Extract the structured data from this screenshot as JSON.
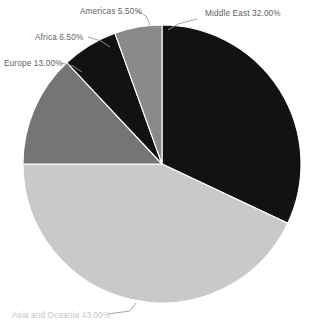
{
  "chart_data": {
    "type": "pie",
    "title": "",
    "subtitle": "",
    "xlabel": "",
    "ylabel": "",
    "legend_position": "none",
    "grid": false,
    "label_format": "{name} {value}%",
    "start_angle_deg": 0,
    "direction": "clockwise",
    "categories": [
      "Middle East",
      "Asia and Oceania",
      "Europe",
      "Africa",
      "Americas"
    ],
    "values": [
      32.0,
      43.0,
      13.0,
      6.5,
      5.5
    ],
    "total": 100.0,
    "slices": [
      {
        "name": "Middle East",
        "value": 32.0,
        "value_text": "32.00%",
        "label": "Middle East 32.00%",
        "color": "#121212",
        "start_angle": 0,
        "end_angle": 115.2,
        "label_anchor": "start",
        "label_x": 205,
        "label_y": 16,
        "leader": "M 197 19 L 178 24 L 168 30",
        "faint": false
      },
      {
        "name": "Asia and Oceania",
        "value": 43.0,
        "value_text": "43.00%",
        "label": "Asia and Oceania 43.00%",
        "color": "#c9c9c9",
        "start_angle": 115.2,
        "end_angle": 270.0,
        "label_anchor": "start",
        "label_x": 12,
        "label_y": 318,
        "leader": "M 108 314 L 130 311 L 136 303",
        "faint": true
      },
      {
        "name": "Europe",
        "value": 13.0,
        "value_text": "13.00%",
        "label": "Europe 13.00%",
        "color": "#757575",
        "start_angle": 270.0,
        "end_angle": 316.8,
        "label_anchor": "start",
        "label_x": 4,
        "label_y": 66,
        "leader": "M 61 63 L 73 66 L 82 72",
        "faint": false
      },
      {
        "name": "Africa",
        "value": 6.5,
        "value_text": "6.50%",
        "label": "Africa 6.50%",
        "color": "#121212",
        "start_angle": 316.8,
        "end_angle": 340.2,
        "label_anchor": "start",
        "label_x": 35,
        "label_y": 40,
        "leader": "M 88 37 L 101 41 L 110 47"
      },
      {
        "name": "Americas",
        "value": 5.5,
        "value_text": "5.50%",
        "label": "Americas 5.50%",
        "color": "#8a8a8a",
        "start_angle": 340.2,
        "end_angle": 360.0,
        "label_anchor": "start",
        "label_x": 80,
        "label_y": 14,
        "leader": "M 137 11 L 146 16 L 150 25",
        "faint": false
      }
    ],
    "geometry": {
      "center_x": 162,
      "center_y": 164,
      "radius": 139
    },
    "colors": {
      "background": "#ffffff",
      "slice_border": "#ffffff",
      "label_text": "#5e5e5e",
      "label_text_faint": "#c6c6c6",
      "leader_line": "#9a9a9a"
    }
  }
}
